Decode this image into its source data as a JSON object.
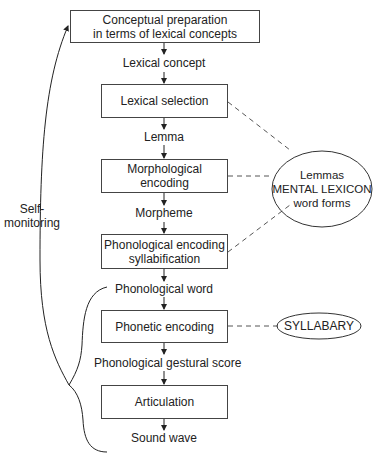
{
  "diagram": {
    "stages": [
      {
        "id": "conceptual",
        "line1": "Conceptual preparation",
        "line2": "in terms of lexical concepts"
      },
      {
        "id": "lexical-selection",
        "line1": "Lexical selection"
      },
      {
        "id": "morphological",
        "line1": "Morphological",
        "line2": "encoding"
      },
      {
        "id": "phonological",
        "line1": "Phonological encoding",
        "line2": "syllabification"
      },
      {
        "id": "phonetic",
        "line1": "Phonetic encoding"
      },
      {
        "id": "articulation",
        "line1": "Articulation"
      }
    ],
    "outputs": [
      "Lexical concept",
      "Lemma",
      "Morpheme",
      "Phonological word",
      "Phonological gestural score",
      "Sound wave"
    ],
    "lexicon": {
      "line1": "Lemmas",
      "line2": "MENTAL LEXICON",
      "line3": "word forms"
    },
    "syllabary": "SYLLABARY",
    "monitoring": {
      "line1": "Self-",
      "line2": "monitoring"
    }
  }
}
